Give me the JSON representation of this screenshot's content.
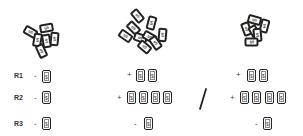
{
  "piles": [
    {
      "name": "pile-left",
      "card_count": 6,
      "card_symbol": "$"
    },
    {
      "name": "pile-middle",
      "card_count": 9,
      "card_symbol": "$"
    },
    {
      "name": "pile-right",
      "card_count": 6,
      "card_symbol": "$"
    }
  ],
  "rows": [
    {
      "label": "R1"
    },
    {
      "label": "R2"
    },
    {
      "label": "R3"
    }
  ],
  "left_column": {
    "r1": {
      "sign": "-",
      "cards": [
        "$"
      ]
    },
    "r2": {
      "sign": "-",
      "cards": [
        "$"
      ]
    },
    "r3": {
      "sign": "-",
      "cards": [
        "$"
      ]
    }
  },
  "middle_column": {
    "r1": {
      "sign": "+",
      "cards": [
        "$",
        "$"
      ]
    },
    "r2": {
      "sign": "+",
      "cards": [
        "$",
        "$",
        "$",
        "$"
      ]
    },
    "r3": {
      "sign": "-",
      "cards": [
        "$"
      ]
    }
  },
  "separator": "/",
  "right_column": {
    "r1": {
      "sign": "+",
      "cards": [
        "$",
        "$"
      ]
    },
    "r2": {
      "sign": "+",
      "cards": [
        "$",
        "$",
        "$",
        "$"
      ]
    },
    "r3": {
      "sign": "-",
      "cards": [
        "$"
      ]
    }
  }
}
